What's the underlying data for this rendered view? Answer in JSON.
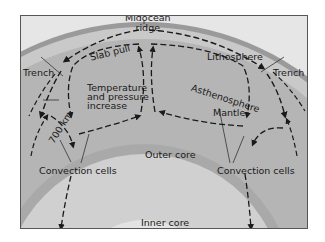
{
  "diagram": {
    "labels": {
      "midocean_ridge": "Midocean ridge",
      "midocean_ridge_line1": "Midocean",
      "midocean_ridge_line2": "ridge",
      "slab_pull": "Slab pull",
      "lithosphere": "Lithosphere",
      "trench_left": "Trench",
      "trench_right": "Trench",
      "asthenosphere": "Asthenosphere",
      "temp_line1": "Temperature",
      "temp_line2": "and pressure",
      "temp_line3": "increase",
      "depth_700": "700 km",
      "mantle": "Mantle",
      "outer_core": "Outer core",
      "inner_core": "Inner core",
      "convection_left": "Convection cells",
      "convection_right": "Convection cells"
    },
    "colors": {
      "background": "#e6e6e6",
      "lithosphere": "#9a9a9a",
      "asthenosphere": "#c4c4c4",
      "mantle": "#b3b3b3",
      "outer_core": "#cfcfcf",
      "inner_core": "#e2e2e2",
      "arrows": "#1a1a1a"
    }
  }
}
